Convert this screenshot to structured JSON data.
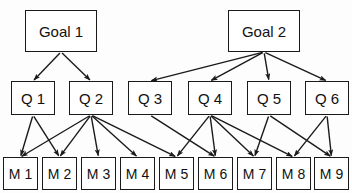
{
  "diagram": {
    "type": "hierarchical-tree",
    "levels": [
      "goal",
      "question",
      "metric"
    ],
    "style": {
      "node_fill": "#ffffff",
      "node_stroke": "#1a1a1a",
      "edge_color": "#1a1a1a",
      "background": "#fdfdfd",
      "text_color": "#111111"
    }
  },
  "goals": [
    {
      "id": "G1",
      "label": "Goal 1",
      "x": 25,
      "y": 10,
      "w": 72,
      "h": 42
    },
    {
      "id": "G2",
      "label": "Goal 2",
      "x": 228,
      "y": 10,
      "w": 72,
      "h": 42
    }
  ],
  "questions": [
    {
      "id": "Q1",
      "label": "Q 1",
      "x": 11,
      "y": 81,
      "w": 44,
      "h": 34
    },
    {
      "id": "Q2",
      "label": "Q 2",
      "x": 69,
      "y": 81,
      "w": 44,
      "h": 34
    },
    {
      "id": "Q3",
      "label": "Q 3",
      "x": 128,
      "y": 81,
      "w": 44,
      "h": 34
    },
    {
      "id": "Q4",
      "label": "Q 4",
      "x": 188,
      "y": 81,
      "w": 44,
      "h": 34
    },
    {
      "id": "Q5",
      "label": "Q 5",
      "x": 247,
      "y": 81,
      "w": 44,
      "h": 34
    },
    {
      "id": "Q6",
      "label": "Q 6",
      "x": 305,
      "y": 81,
      "w": 44,
      "h": 34
    }
  ],
  "metrics": [
    {
      "id": "M1",
      "label": "M 1",
      "x": 3,
      "y": 157,
      "w": 35,
      "h": 33
    },
    {
      "id": "M2",
      "label": "M 2",
      "x": 42,
      "y": 157,
      "w": 35,
      "h": 33
    },
    {
      "id": "M3",
      "label": "M 3",
      "x": 81,
      "y": 157,
      "w": 35,
      "h": 33
    },
    {
      "id": "M4",
      "label": "M 4",
      "x": 120,
      "y": 157,
      "w": 35,
      "h": 33
    },
    {
      "id": "M5",
      "label": "M 5",
      "x": 159,
      "y": 157,
      "w": 35,
      "h": 33
    },
    {
      "id": "M6",
      "label": "M 6",
      "x": 198,
      "y": 157,
      "w": 35,
      "h": 33
    },
    {
      "id": "M7",
      "label": "M 7",
      "x": 237,
      "y": 157,
      "w": 35,
      "h": 33
    },
    {
      "id": "M8",
      "label": "M 8",
      "x": 276,
      "y": 157,
      "w": 35,
      "h": 33
    },
    {
      "id": "M9",
      "label": "M 9",
      "x": 314,
      "y": 157,
      "w": 35,
      "h": 33
    }
  ],
  "edges": [
    {
      "from": "G1",
      "to": "Q1"
    },
    {
      "from": "G1",
      "to": "Q2"
    },
    {
      "from": "G2",
      "to": "Q3"
    },
    {
      "from": "G2",
      "to": "Q4"
    },
    {
      "from": "G2",
      "to": "Q5"
    },
    {
      "from": "G2",
      "to": "Q6"
    },
    {
      "from": "Q1",
      "to": "M1"
    },
    {
      "from": "Q1",
      "to": "M2"
    },
    {
      "from": "Q2",
      "to": "M1"
    },
    {
      "from": "Q2",
      "to": "M2"
    },
    {
      "from": "Q2",
      "to": "M3"
    },
    {
      "from": "Q2",
      "to": "M4"
    },
    {
      "from": "Q2",
      "to": "M5"
    },
    {
      "from": "Q3",
      "to": "M6"
    },
    {
      "from": "Q4",
      "to": "M5"
    },
    {
      "from": "Q4",
      "to": "M6"
    },
    {
      "from": "Q4",
      "to": "M7"
    },
    {
      "from": "Q4",
      "to": "M8"
    },
    {
      "from": "Q5",
      "to": "M7"
    },
    {
      "from": "Q5",
      "to": "M9"
    },
    {
      "from": "Q6",
      "to": "M8"
    },
    {
      "from": "Q6",
      "to": "M9"
    }
  ]
}
